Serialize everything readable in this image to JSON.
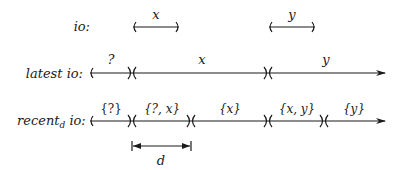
{
  "rows": {
    "io": {
      "label": "io:",
      "intervals": [
        {
          "label": "x",
          "x1": 133,
          "x2": 179
        },
        {
          "label": "y",
          "x1": 269,
          "x2": 315
        }
      ]
    },
    "latest": {
      "label": "latest io:",
      "segments": [
        {
          "label": "?"
        },
        {
          "label": "x"
        },
        {
          "label": "y"
        }
      ]
    },
    "recent": {
      "label_main": "recent",
      "label_sub": "d",
      "label_tail": " io:",
      "segments": [
        {
          "label": "{?}"
        },
        {
          "label": "{?, x}"
        },
        {
          "label": "{x}"
        },
        {
          "label": "{x, y}"
        },
        {
          "label": "{y}"
        }
      ]
    }
  },
  "dimension": {
    "label": "d"
  },
  "colors": {
    "ink": "#1a1a1a",
    "background": "#ffffff"
  }
}
